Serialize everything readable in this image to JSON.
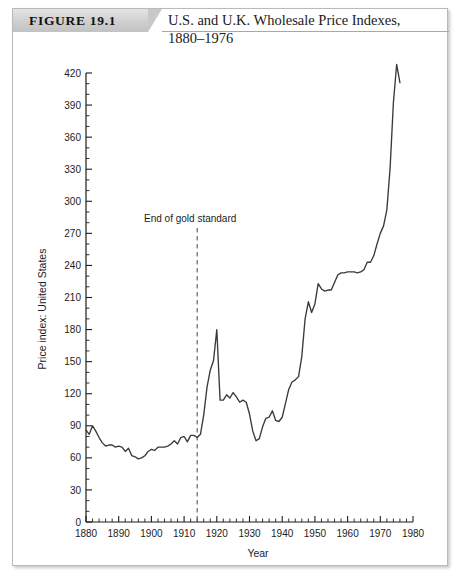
{
  "figure": {
    "tag": "FIGURE 19.1",
    "title_line1": "U.S. and U.K. Wholesale Price Indexes,",
    "title_line2": "1880–1976",
    "panel_label": "(a)"
  },
  "colors": {
    "line": "#3a3a3a",
    "axis": "#1c1c1c",
    "frame": "#b9b9b9",
    "tag_band": "#c8c8c8",
    "text": "#1c1c1c"
  },
  "chart_data": {
    "type": "line",
    "title": "U.S. and U.K. Wholesale Price Indexes, 1880–1976",
    "xlabel": "Year",
    "ylabel": "Price index: United States",
    "xlim": [
      1880,
      1980
    ],
    "ylim": [
      0,
      420
    ],
    "xticks": [
      1880,
      1890,
      1900,
      1910,
      1920,
      1930,
      1940,
      1950,
      1960,
      1970,
      1980
    ],
    "yticks": [
      0,
      30,
      60,
      90,
      120,
      150,
      180,
      210,
      240,
      270,
      300,
      330,
      360,
      390,
      420
    ],
    "y_minor_step": 10,
    "x_minor_step": 2,
    "grid": false,
    "legend": false,
    "annotations": [
      {
        "text": "End of gold standard",
        "x": 1914,
        "line_style": "dashed",
        "line_top": 275,
        "line_bottom": 0
      }
    ],
    "series": [
      {
        "name": "Price index: United States",
        "x": [
          1880,
          1881,
          1882,
          1883,
          1884,
          1885,
          1886,
          1887,
          1888,
          1889,
          1890,
          1891,
          1892,
          1893,
          1894,
          1895,
          1896,
          1897,
          1898,
          1899,
          1900,
          1901,
          1902,
          1903,
          1904,
          1905,
          1906,
          1907,
          1908,
          1909,
          1910,
          1911,
          1912,
          1913,
          1914,
          1915,
          1916,
          1917,
          1918,
          1919,
          1920,
          1921,
          1922,
          1923,
          1924,
          1925,
          1926,
          1927,
          1928,
          1929,
          1930,
          1931,
          1932,
          1933,
          1934,
          1935,
          1936,
          1937,
          1938,
          1939,
          1940,
          1941,
          1942,
          1943,
          1944,
          1945,
          1946,
          1947,
          1948,
          1949,
          1950,
          1951,
          1952,
          1953,
          1954,
          1955,
          1956,
          1957,
          1958,
          1959,
          1960,
          1961,
          1962,
          1963,
          1964,
          1965,
          1966,
          1967,
          1968,
          1969,
          1970,
          1971,
          1972,
          1973,
          1974,
          1975,
          1976
        ],
        "values": [
          86,
          82,
          90,
          85,
          79,
          74,
          71,
          72,
          72,
          70,
          71,
          70,
          66,
          69,
          62,
          61,
          59,
          60,
          62,
          66,
          68,
          67,
          70,
          70,
          70,
          71,
          73,
          76,
          73,
          79,
          80,
          75,
          81,
          81,
          79,
          82,
          100,
          126,
          142,
          151,
          180,
          114,
          114,
          119,
          116,
          121,
          117,
          112,
          114,
          112,
          101,
          85,
          76,
          78,
          89,
          97,
          98,
          104,
          95,
          94,
          98,
          111,
          124,
          131,
          133,
          136,
          155,
          190,
          206,
          196,
          204,
          223,
          218,
          216,
          217,
          217,
          224,
          231,
          233,
          233,
          234,
          234,
          234,
          233,
          234,
          236,
          243,
          243,
          249,
          260,
          270,
          277,
          292,
          331,
          392,
          428,
          411
        ]
      }
    ]
  }
}
